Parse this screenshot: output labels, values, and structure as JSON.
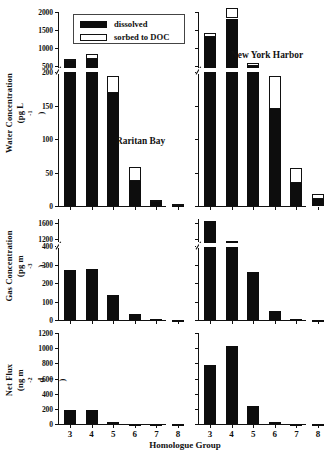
{
  "figure": {
    "x_axis_title": "Homologue Group",
    "site_left": "Raritan Bay",
    "site_right": "New York Harbor"
  },
  "legend": {
    "dissolved_label": "dissolved",
    "sorbed_label": "sorbed to DOC"
  },
  "panels": {
    "water": {
      "y_title_line1": "Water Concentration",
      "y_title_line2": "(pg L-1)",
      "ticks_lower": [
        "0",
        "50",
        "100",
        "150",
        "200"
      ],
      "ticks_upper": [
        "500",
        "1000",
        "1500",
        "2000"
      ]
    },
    "gas": {
      "y_title_line1": "Gas Concentration",
      "y_title_line2": "(pg m-3)",
      "ticks_lower": [
        "0",
        "100",
        "200",
        "300",
        "400"
      ],
      "ticks_upper": [
        "1200",
        "1600"
      ]
    },
    "flux": {
      "y_title_line1": "Net Flux",
      "y_title_line2": "(ng m-2 d-1)",
      "ticks": [
        "0",
        "200",
        "400",
        "600",
        "800",
        "1000",
        "1200"
      ]
    }
  },
  "chart_data": [
    {
      "type": "bar",
      "title": "Water Concentration — Raritan Bay",
      "xlabel": "Homologue Group",
      "ylabel": "Water Concentration (pg L-1)",
      "categories": [
        "3",
        "4",
        "5",
        "6",
        "7",
        "8"
      ],
      "broken_axis": true,
      "ylim_lower": [
        0,
        200
      ],
      "ylim_upper": [
        450,
        2000
      ],
      "series": [
        {
          "name": "dissolved",
          "values": [
            650,
            690,
            168,
            37,
            6,
            2
          ]
        },
        {
          "name": "sorbed to DOC",
          "values": [
            40,
            140,
            52,
            21,
            3,
            1
          ]
        }
      ],
      "totals": [
        690,
        830,
        220,
        58,
        9,
        3
      ]
    },
    {
      "type": "bar",
      "title": "Water Concentration — New York Harbor",
      "xlabel": "Homologue Group",
      "ylabel": "Water Concentration (pg L-1)",
      "categories": [
        "3",
        "4",
        "5",
        "6",
        "7",
        "8"
      ],
      "broken_axis": true,
      "ylim_lower": [
        0,
        200
      ],
      "ylim_upper": [
        450,
        2000
      ],
      "series": [
        {
          "name": "dissolved",
          "values": [
            1320,
            1820,
            500,
            145,
            34,
            10
          ]
        },
        {
          "name": "sorbed to DOC",
          "values": [
            110,
            280,
            80,
            70,
            23,
            8
          ]
        }
      ],
      "totals": [
        1430,
        2100,
        580,
        215,
        57,
        18
      ]
    },
    {
      "type": "bar",
      "title": "Gas Concentration — Raritan Bay",
      "xlabel": "Homologue Group",
      "ylabel": "Gas Concentration (pg m-3)",
      "categories": [
        "3",
        "4",
        "5",
        "6",
        "7",
        "8"
      ],
      "broken_axis": true,
      "ylim_lower": [
        0,
        400
      ],
      "ylim_upper": [
        1100,
        1700
      ],
      "values": [
        420,
        440,
        135,
        35,
        5,
        1
      ]
    },
    {
      "type": "bar",
      "title": "Gas Concentration — New York Harbor",
      "xlabel": "Homologue Group",
      "ylabel": "Gas Concentration (pg m-3)",
      "categories": [
        "3",
        "4",
        "5",
        "6",
        "7",
        "8"
      ],
      "broken_axis": true,
      "ylim_lower": [
        0,
        400
      ],
      "ylim_upper": [
        1100,
        1700
      ],
      "values": [
        1650,
        1150,
        260,
        50,
        6,
        2
      ]
    },
    {
      "type": "bar",
      "title": "Net Flux — Raritan Bay",
      "xlabel": "Homologue Group",
      "ylabel": "Net Flux (ng m-2 d-1)",
      "categories": [
        "3",
        "4",
        "5",
        "6",
        "7",
        "8"
      ],
      "broken_axis": false,
      "ylim": [
        0,
        1200
      ],
      "values": [
        180,
        180,
        30,
        4,
        1,
        0
      ]
    },
    {
      "type": "bar",
      "title": "Net Flux — New York Harbor",
      "xlabel": "Homologue Group",
      "ylabel": "Net Flux (ng m-2 d-1)",
      "categories": [
        "3",
        "4",
        "5",
        "6",
        "7",
        "8"
      ],
      "broken_axis": false,
      "ylim": [
        0,
        1200
      ],
      "values": [
        780,
        1030,
        240,
        30,
        3,
        0
      ]
    }
  ]
}
